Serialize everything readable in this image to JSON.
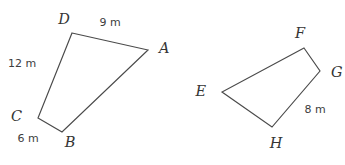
{
  "figure": {
    "background_color": "#ffffff",
    "stroke_color": "#4a4a4a",
    "label_color": "#353535",
    "units": "m"
  },
  "shapes": [
    {
      "name": "quadrilateral-abcd",
      "vertex_order": "D-A-B-C-D",
      "vertices": [
        {
          "id": "D",
          "label": "D",
          "x": 72,
          "y": 33,
          "label_x": 64,
          "label_y": 20
        },
        {
          "id": "A",
          "label": "A",
          "x": 148,
          "y": 50,
          "label_x": 159,
          "label_y": 49
        },
        {
          "id": "B",
          "label": "B",
          "x": 62,
          "y": 132,
          "label_x": 70,
          "label_y": 143
        },
        {
          "id": "C",
          "label": "C",
          "x": 38,
          "y": 118,
          "label_x": 22,
          "label_y": 117
        }
      ],
      "sides": [
        {
          "id": "DA",
          "label": "9 m",
          "value": 9,
          "label_x": 110,
          "label_y": 23
        },
        {
          "id": "CD",
          "label": "12 m",
          "value": 12,
          "label_x": 22,
          "label_y": 64
        },
        {
          "id": "CB",
          "label": "6 m",
          "value": 6,
          "label_x": 28,
          "label_y": 139
        }
      ]
    },
    {
      "name": "quadrilateral-efgh",
      "vertex_order": "F-G-H-E-F",
      "vertices": [
        {
          "id": "F",
          "label": "F",
          "x": 304,
          "y": 48,
          "label_x": 300,
          "label_y": 34
        },
        {
          "id": "G",
          "label": "G",
          "x": 320,
          "y": 71,
          "label_x": 331,
          "label_y": 73
        },
        {
          "id": "H",
          "label": "H",
          "x": 272,
          "y": 127,
          "label_x": 276,
          "label_y": 144
        },
        {
          "id": "E",
          "label": "E",
          "x": 222,
          "y": 92,
          "label_x": 206,
          "label_y": 92
        }
      ],
      "sides": [
        {
          "id": "GH",
          "label": "8 m",
          "value": 8,
          "label_x": 315,
          "label_y": 110
        }
      ]
    }
  ]
}
